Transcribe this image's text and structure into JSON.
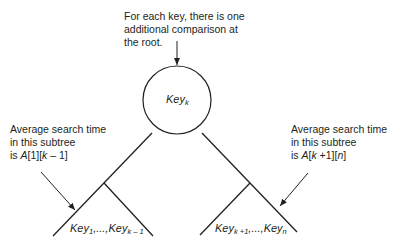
{
  "diagram": {
    "top_note": {
      "line1": "For each key, there is one",
      "line2": "additional comparison at",
      "line3": "the root."
    },
    "root_node": {
      "label": "Key",
      "subscript": "k"
    },
    "left_note": {
      "line1": "Average search time",
      "line2": "in this subtree",
      "line3_prefix": "is ",
      "line3_A": "A",
      "line3_rest": "[1][",
      "line3_k": "k",
      "line3_end": " – 1]"
    },
    "right_note": {
      "line1": "Average search time",
      "line2": "in this subtree",
      "line3_prefix": "is ",
      "line3_A": "A",
      "line3_bracket": "[",
      "line3_k": "k",
      "line3_mid": " +1][",
      "line3_n": "n",
      "line3_end": "]"
    },
    "left_subtree_keys": {
      "first": "Key",
      "first_sub": "1",
      "sep": ",...,",
      "last": "Key",
      "last_sub": "k – 1"
    },
    "right_subtree_keys": {
      "first": "Key",
      "first_sub": "k +1",
      "sep": ",...,",
      "last": "Key",
      "last_sub": "n"
    },
    "colors": {
      "stroke": "#231f20",
      "background": "#ffffff"
    }
  }
}
